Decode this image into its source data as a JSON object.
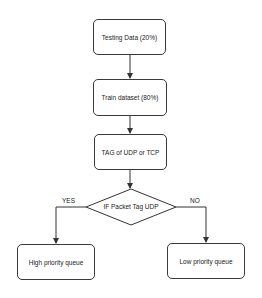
{
  "diagram": {
    "nodes": {
      "testing": "Testing Data (20%)",
      "train": "Train dataset (80%)",
      "tag": "TAG of UDP or TCP",
      "decision": "IF Packet Tag UDP",
      "high": "High priority queue",
      "low": "Low priority queue"
    },
    "edges": {
      "yes": "YES",
      "no": "NO"
    },
    "colors": {
      "stroke": "#3a3a3a",
      "background": "#ffffff"
    }
  }
}
